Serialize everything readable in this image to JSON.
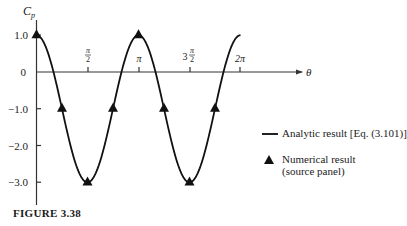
{
  "chart_data": {
    "type": "line",
    "title": "",
    "xlabel": "θ",
    "ylabel": "C_p",
    "xlim": [
      0,
      6.6
    ],
    "ylim": [
      -3.6,
      1.4
    ],
    "grid": false,
    "x_ticks": [
      {
        "value": 1.5708,
        "label": "π/2"
      },
      {
        "value": 3.1416,
        "label": "π"
      },
      {
        "value": 4.7124,
        "label": "3π/2"
      },
      {
        "value": 6.2832,
        "label": "2π"
      }
    ],
    "y_ticks": [
      {
        "value": 1.0,
        "label": "1.0"
      },
      {
        "value": 0,
        "label": "0"
      },
      {
        "value": -1.0,
        "label": "−1.0"
      },
      {
        "value": -2.0,
        "label": "−2.0"
      },
      {
        "value": -3.0,
        "label": "−3.0"
      }
    ],
    "series": [
      {
        "name": "Analytic result [Eq. (3.101)]",
        "style": "line",
        "formula": "Cp = 1 - 4 sin^2(theta)",
        "x": [
          0,
          0.3927,
          0.7854,
          1.1781,
          1.5708,
          1.9635,
          2.3562,
          2.7489,
          3.1416,
          3.5343,
          3.927,
          4.3197,
          4.7124,
          5.1051,
          5.4978,
          5.8905,
          6.2832
        ],
        "values": [
          1.0,
          0.414,
          -1.0,
          -2.414,
          -3.0,
          -2.414,
          -1.0,
          0.414,
          1.0,
          0.414,
          -1.0,
          -2.414,
          -3.0,
          -2.414,
          -1.0,
          0.414,
          1.0
        ]
      },
      {
        "name": "Numerical result (source panel)",
        "style": "triangle-markers",
        "x": [
          0,
          0.7854,
          1.5708,
          2.3562,
          3.1416,
          3.927,
          4.7124,
          5.4978
        ],
        "values": [
          1.0,
          -1.0,
          -3.0,
          -1.0,
          1.0,
          -1.0,
          -3.0,
          -1.0
        ]
      }
    ],
    "legend": {
      "position": "right",
      "entries": [
        {
          "symbol": "line",
          "label": "Analytic result [Eq. (3.101)]"
        },
        {
          "symbol": "triangle",
          "label_line1": "Numerical result",
          "label_line2": "(source panel)"
        }
      ]
    },
    "caption": "FIGURE 3.38",
    "colors": {
      "line": "#111111",
      "marker": "#111111",
      "axis": "#333333"
    }
  },
  "labels": {
    "y_axis": "C",
    "y_axis_sub": "p",
    "x_axis": "θ",
    "tick_pi_half_num": "π",
    "tick_pi_half_den": "2",
    "tick_pi": "π",
    "tick_3pi_half_coef": "3",
    "tick_3pi_half_num": "π",
    "tick_3pi_half_den": "2",
    "tick_2pi": "2π",
    "y1": "1.0",
    "y0": "0",
    "ym1": "−1.0",
    "ym2": "−2.0",
    "ym3": "−3.0",
    "legend_analytic": "Analytic result [Eq. (3.101)]",
    "legend_numeric_1": "Numerical result",
    "legend_numeric_2": "(source panel)",
    "caption": "FIGURE 3.38"
  }
}
